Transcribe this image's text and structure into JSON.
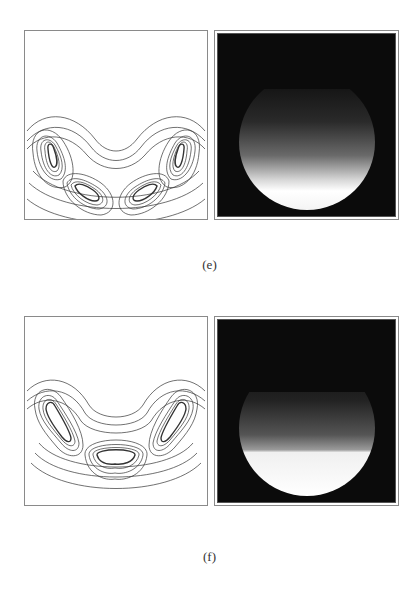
{
  "figures": [
    {
      "id": "e",
      "caption": "(e)",
      "left_panel": {
        "type": "contour-plot",
        "description": "contour lines of a crescent-shaped density with four lobes (two outer, two inner near center)"
      },
      "right_panel": {
        "type": "grayscale-density-map",
        "description": "disk with gradient brightening toward bottom, bright crescent band near the lower rim"
      }
    },
    {
      "id": "f",
      "caption": "(f)",
      "left_panel": {
        "type": "contour-plot",
        "description": "contour lines of a crescent-shaped density with two outer elongated lobes and one central elongated lobe"
      },
      "right_panel": {
        "type": "grayscale-density-map",
        "description": "disk with gradient brightening downward, sharp white lower segment"
      }
    }
  ],
  "colors": {
    "background": "#ffffff",
    "frame": "#8a8a8a",
    "contour_line": "#333333",
    "map_background": "#0b0b0b"
  }
}
